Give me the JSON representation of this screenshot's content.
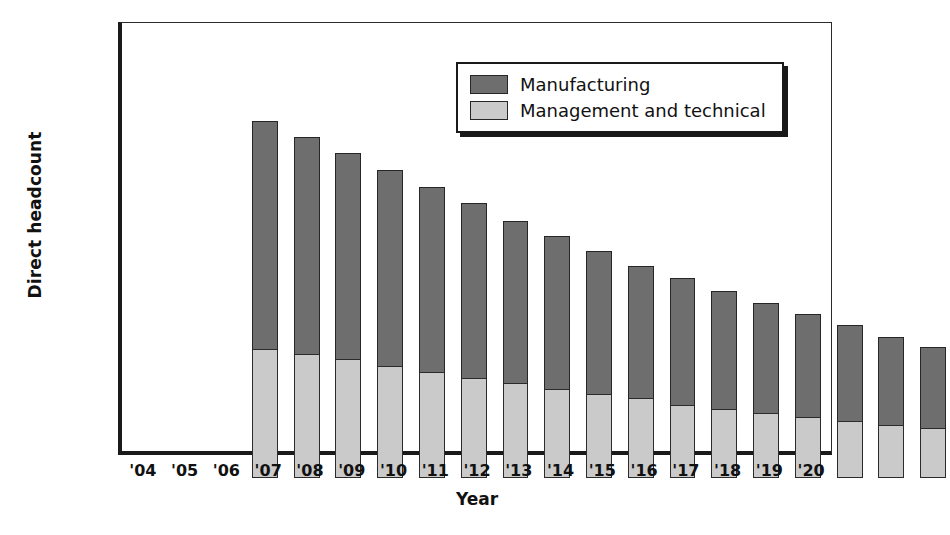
{
  "chart_data": {
    "type": "bar",
    "subtype": "stacked-vertical",
    "title": "",
    "xlabel": "Year",
    "ylabel": "Direct headcount",
    "ylim": [
      0,
      16000
    ],
    "ytick_step": 2000,
    "yticks": [
      0,
      2000,
      4000,
      6000,
      8000,
      10000,
      12000,
      14000,
      16000
    ],
    "ytick_labels": [
      "0",
      "2,000",
      "4,000",
      "6,000",
      "8,000",
      "10,000",
      "12,000",
      "14,000",
      "16,000"
    ],
    "grid": false,
    "legend_position": "top-right-inside",
    "categories": [
      "'04",
      "'05",
      "'06",
      "'07",
      "'08",
      "'09",
      "'10",
      "'11",
      "'12",
      "'13",
      "'14",
      "'15",
      "'16",
      "'17",
      "'18",
      "'19",
      "'20"
    ],
    "series": [
      {
        "name": "Manufacturing",
        "color": "#6e6e6e",
        "values": [
          8450,
          8000,
          7600,
          7250,
          6850,
          6450,
          6000,
          5650,
          5300,
          4900,
          4700,
          4350,
          4050,
          3800,
          3550,
          3250,
          3000
        ]
      },
      {
        "name": "Management and technical",
        "color": "#cacaca",
        "values": [
          4750,
          4600,
          4400,
          4150,
          3900,
          3700,
          3500,
          3300,
          3100,
          2950,
          2700,
          2550,
          2400,
          2250,
          2100,
          1950,
          1850
        ]
      }
    ],
    "totals": [
      13200,
      12600,
      12000,
      11400,
      10750,
      10150,
      9500,
      8950,
      8400,
      7850,
      7400,
      6900,
      6450,
      6050,
      5650,
      5200,
      4850
    ]
  },
  "legend": {
    "items": [
      {
        "label": "Manufacturing",
        "color": "#6e6e6e"
      },
      {
        "label": "Management and technical",
        "color": "#cacaca"
      }
    ]
  }
}
